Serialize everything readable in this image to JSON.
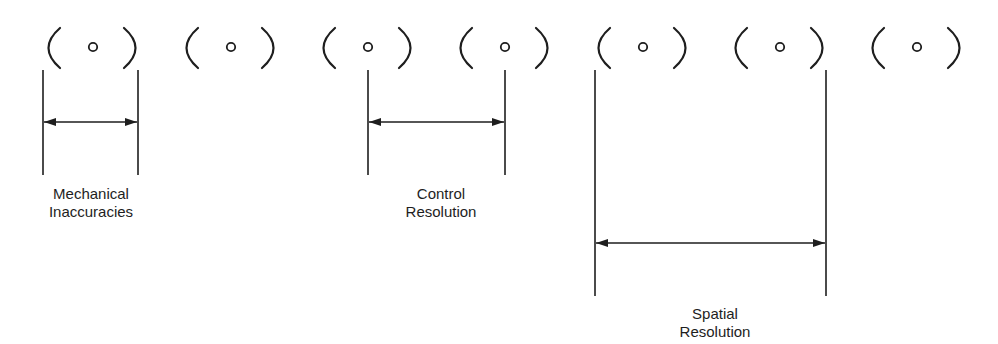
{
  "diagram": {
    "ink_color": "#1e1e1e",
    "background": "#ffffff",
    "cells": [
      {
        "center_x": 93
      },
      {
        "center_x": 231
      },
      {
        "center_x": 368
      },
      {
        "center_x": 505
      },
      {
        "center_x": 643
      },
      {
        "center_x": 780
      },
      {
        "center_x": 917
      }
    ],
    "dimensions": [
      {
        "name": "mechanical-inaccuracies",
        "label_line1": "Mechanical",
        "label_line2": "Inaccuracies",
        "x1": 43,
        "x2": 138,
        "arrow_y": 122,
        "line_bottom": 175
      },
      {
        "name": "control-resolution",
        "label_line1": "Control",
        "label_line2": "Resolution",
        "x1": 368,
        "x2": 505,
        "arrow_y": 122,
        "line_bottom": 175
      },
      {
        "name": "spatial-resolution",
        "label_line1": "Spatial",
        "label_line2": "Resolution",
        "x1": 595,
        "x2": 826,
        "arrow_y": 243,
        "line_bottom": 296
      }
    ]
  }
}
